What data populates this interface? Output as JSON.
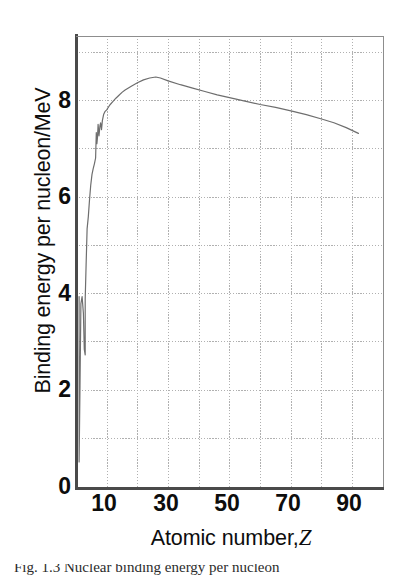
{
  "figure": {
    "kind": "line-graph",
    "background_color": "#ffffff",
    "ink_color": "#0d0d0d",
    "curve_color": "#6e6e6e",
    "grid_color": "#b4b4b4",
    "axis_color": "#555555"
  },
  "axes": {
    "y_title": "Binding energy per nucleon/MeV",
    "x_title_text": "Atomic number,",
    "x_title_symbol": "Z",
    "y_tick_labels": [
      "8",
      "6",
      "4",
      "2",
      "0"
    ],
    "y_tick_values": [
      8,
      6,
      4,
      2,
      0
    ],
    "x_tick_labels": [
      "10",
      "30",
      "50",
      "70",
      "90"
    ],
    "x_tick_values": [
      10,
      30,
      50,
      70,
      90
    ]
  },
  "caption": {
    "cut_off_line": "Fig. 1.3  Nuclear binding energy per nucleon"
  },
  "chart_data": {
    "type": "line",
    "title": "",
    "subtitle": "",
    "xlabel": "Atomic number, Z",
    "ylabel": "Binding energy per nucleon/MeV",
    "xlim": [
      0,
      100
    ],
    "ylim": [
      0,
      9.35
    ],
    "grid": true,
    "grid_x_step": 10,
    "grid_y_step": 1,
    "legend": "none",
    "x_tick_labels": [
      "10",
      "30",
      "50",
      "70",
      "90"
    ],
    "y_tick_labels": [
      "0",
      "2",
      "4",
      "6",
      "8"
    ],
    "annotations": [],
    "series": [
      {
        "name": "Binding energy per nucleon",
        "x": [
          1.0,
          1.0,
          1.3,
          1.6,
          2.0,
          2.4,
          2.7,
          3.0,
          3.0,
          3.3,
          3.6,
          4.0,
          4.4,
          4.8,
          5.2,
          5.6,
          6.0,
          6.4,
          6.6,
          6.8,
          7.0,
          7.2,
          7.5,
          7.8,
          8.0,
          8.3,
          8.6,
          9.0,
          9.4,
          10.0,
          11.0,
          12.0,
          13.0,
          14.0,
          15.0,
          16.0,
          18.0,
          20.0,
          22.0,
          24.0,
          26.0,
          27.5,
          30.0,
          34.0,
          38.0,
          42.0,
          46.0,
          50.0,
          55.0,
          60.0,
          65.0,
          70.0,
          75.0,
          80.0,
          84.0,
          88.0,
          92.0
        ],
        "y": [
          3.95,
          0.52,
          2.1,
          3.8,
          3.95,
          3.6,
          2.85,
          2.74,
          3.9,
          4.6,
          5.35,
          5.6,
          5.95,
          6.25,
          6.48,
          6.6,
          6.7,
          6.82,
          7.35,
          7.12,
          7.25,
          7.52,
          7.28,
          7.48,
          7.55,
          7.41,
          7.6,
          7.72,
          7.78,
          7.82,
          7.92,
          7.99,
          8.06,
          8.12,
          8.18,
          8.23,
          8.31,
          8.38,
          8.44,
          8.48,
          8.5,
          8.48,
          8.42,
          8.34,
          8.27,
          8.2,
          8.13,
          8.07,
          8.0,
          7.93,
          7.87,
          7.8,
          7.72,
          7.63,
          7.55,
          7.45,
          7.33
        ],
        "color": "#6e6e6e",
        "marker": "none",
        "linewidth": 1.2
      }
    ],
    "notes": {
      "peak_value": 8.5,
      "peak_x": 26,
      "endpoint_value": 7.33,
      "endpoint_x": 92,
      "minimum_value": 0.52,
      "minimum_x": 1
    }
  }
}
